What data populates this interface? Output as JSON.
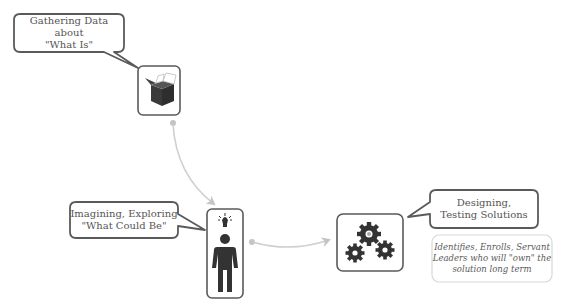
{
  "diagram": {
    "nodes": [
      {
        "id": "gathering",
        "icon": "open-box-icon",
        "callout_lines": [
          "Gathering Data about",
          "\"What Is\""
        ]
      },
      {
        "id": "imagining",
        "icon": "person-lightbulb-icon",
        "callout_lines": [
          "Imagining, Exploring",
          "\"What Could Be\""
        ]
      },
      {
        "id": "designing",
        "icon": "gears-icon",
        "callout_lines": [
          "Designing,",
          "Testing Solutions"
        ],
        "note_lines": [
          "Identifies, Enrolls, Servant",
          "Leaders who will \"own\" the",
          "solution long term"
        ]
      }
    ],
    "connectors": [
      {
        "from": "gathering",
        "to": "imagining"
      },
      {
        "from": "imagining",
        "to": "designing"
      }
    ],
    "colors": {
      "outline": "#5a5a5a",
      "connector": "#c8c8c8",
      "icon_fill": "#3a3a3a",
      "note_border": "#d8d8d8",
      "text": "#555555"
    }
  }
}
